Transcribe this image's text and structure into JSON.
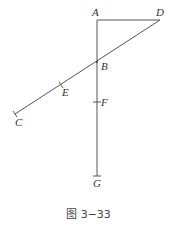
{
  "caption": "图 3−33",
  "colors": {
    "line": "#555555",
    "label": "#333333",
    "caption": "#444444",
    "background": "#ffffff"
  },
  "points": {
    "A": {
      "label": "A",
      "x": 97,
      "y": 20
    },
    "D": {
      "label": "D",
      "x": 160,
      "y": 20
    },
    "B": {
      "label": "B",
      "x": 97,
      "y": 62
    },
    "E": {
      "label": "E",
      "x": 61,
      "y": 85
    },
    "C": {
      "label": "C",
      "x": 15,
      "y": 114
    },
    "F": {
      "label": "F",
      "x": 97,
      "y": 102
    },
    "G": {
      "label": "G",
      "x": 97,
      "y": 176
    }
  },
  "segments": [
    {
      "from": "A",
      "to": "G",
      "name": "vertical-segment-AG"
    },
    {
      "from": "A",
      "to": "D",
      "name": "horizontal-segment-AD"
    },
    {
      "from": "D",
      "to": "C",
      "name": "slanted-segment-DC"
    }
  ]
}
